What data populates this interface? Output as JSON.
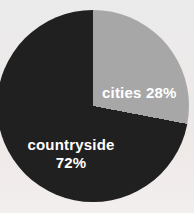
{
  "chart_data": {
    "type": "pie",
    "title": "",
    "unit": "%",
    "start_angle_deg": 0,
    "direction": "clockwise",
    "legend": "none",
    "labels_on_slices": true,
    "label_color": "#ffffff",
    "background_color": "#edebea",
    "slices": [
      {
        "label": "cities",
        "value": 28,
        "color": "#a7a7a7",
        "display": "cities 28%"
      },
      {
        "label": "countryside",
        "value": 72,
        "color": "#212020",
        "display_line1": "countryside",
        "display_line2": "72%"
      }
    ]
  }
}
